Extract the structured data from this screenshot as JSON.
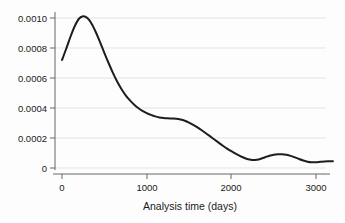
{
  "chart_data": {
    "type": "line",
    "title": "",
    "subtitle": "",
    "xlabel": "Analysis time (days)",
    "ylabel": "",
    "xlim": [
      -50,
      3250
    ],
    "ylim": [
      0,
      0.00106
    ],
    "grid": true,
    "legend": null,
    "xticks": [
      0,
      1000,
      2000,
      3000
    ],
    "xticklabels": [
      "0",
      "1000",
      "2000",
      "3000"
    ],
    "yticks": [
      0,
      0.0002,
      0.0004,
      0.0006,
      0.0008,
      0.001
    ],
    "yticklabels": [
      "0",
      "0.0002",
      "0.0004",
      "0.0006",
      "0.0008",
      "0.0010"
    ],
    "series": [
      {
        "name": "smoothed hazard",
        "color": "#1c1c22",
        "x": [
          0,
          50,
          100,
          150,
          200,
          250,
          300,
          350,
          400,
          450,
          500,
          550,
          600,
          650,
          700,
          750,
          800,
          850,
          900,
          950,
          1000,
          1050,
          1100,
          1150,
          1200,
          1250,
          1300,
          1350,
          1400,
          1450,
          1500,
          1550,
          1600,
          1650,
          1700,
          1750,
          1800,
          1850,
          1900,
          1950,
          2000,
          2050,
          2100,
          2150,
          2200,
          2250,
          2300,
          2350,
          2400,
          2450,
          2500,
          2550,
          2600,
          2650,
          2700,
          2750,
          2800,
          2850,
          2900,
          2950,
          3000,
          3050,
          3100,
          3150,
          3200
        ],
        "y": [
          0.00072,
          0.000795,
          0.000875,
          0.000945,
          0.000995,
          0.001012,
          0.001,
          0.000962,
          0.000905,
          0.000838,
          0.000768,
          0.0007,
          0.000636,
          0.000578,
          0.000528,
          0.000486,
          0.000452,
          0.000424,
          0.0004,
          0.000381,
          0.000366,
          0.000354,
          0.000344,
          0.000337,
          0.000333,
          0.000331,
          0.00033,
          0.000328,
          0.000323,
          0.000315,
          0.000303,
          0.000288,
          0.000271,
          0.000252,
          0.000232,
          0.000211,
          0.00019,
          0.000169,
          0.000148,
          0.000129,
          0.000112,
          9.6e-05,
          8.1e-05,
          6.8e-05,
          5.8e-05,
          5.3e-05,
          5.5e-05,
          6.2e-05,
          7.2e-05,
          8.2e-05,
          8.9e-05,
          9.2e-05,
          9.2e-05,
          8.8e-05,
          8.1e-05,
          7.1e-05,
          6e-05,
          5e-05,
          4.2e-05,
          3.8e-05,
          3.8e-05,
          4.1e-05,
          4.4e-05,
          4.5e-05,
          4.5e-05
        ]
      }
    ]
  },
  "axes": {
    "x_label": "Analysis time (days)",
    "x_tick_labels": [
      "0",
      "1000",
      "2000",
      "3000"
    ],
    "y_tick_labels": [
      "0.0010",
      "0.0008",
      "0.0006",
      "0.0004",
      "0.0002",
      "0"
    ]
  }
}
